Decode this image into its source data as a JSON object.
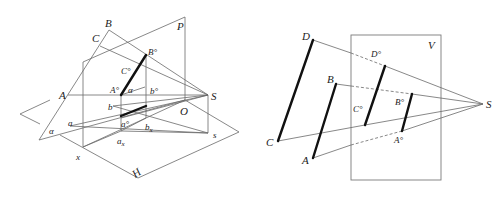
{
  "left_figure": {
    "title": "Perspective projection with picture plane P and ground plane H",
    "labels": {
      "B": "B",
      "C": "C",
      "P": "P",
      "A": "A",
      "S": "S",
      "O": "O",
      "B0": "B°",
      "C0": "C°",
      "A0": "A°",
      "b0": "b°",
      "alpha_top": "α",
      "b": "b",
      "a0": "a°",
      "bx": "b",
      "bx_sub": "x",
      "a": "a",
      "ax": "a",
      "ax_sub": "x",
      "alpha_left": "α",
      "x": "x",
      "s": "s",
      "H": "H"
    }
  },
  "right_figure": {
    "title": "Perspective of parallel segments onto picture plane V",
    "labels": {
      "D": "D",
      "B": "B",
      "C": "C",
      "A": "A",
      "V": "V",
      "D0": "D°",
      "C0": "C°",
      "B0": "B°",
      "A0": "A°",
      "S": "S"
    }
  },
  "colors": {
    "line": "#6a6a6a",
    "bold_segment": "#111111",
    "background": "#ffffff"
  }
}
